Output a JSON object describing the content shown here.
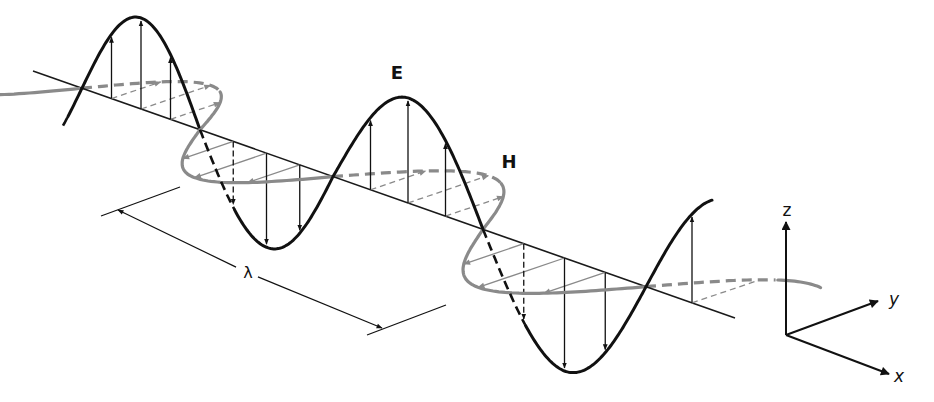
{
  "diagram": {
    "labels": {
      "electric_field": "E",
      "magnetic_field": "H",
      "wavelength": "λ",
      "axis_z": "z",
      "axis_y": "y",
      "axis_x": "x"
    },
    "colors": {
      "electric_field": "#111111",
      "magnetic_field": "#8a8a8a",
      "axis": "#1a1a1a",
      "background": "#ffffff"
    },
    "propagation_axis": {
      "start": [
        33,
        71
      ],
      "end": [
        735,
        318
      ]
    },
    "node_x_positions": [
      82,
      200,
      333,
      483,
      646
    ],
    "e_amplitudes": [
      91,
      94,
      105,
      113,
      115
    ],
    "h_direction": [
      1,
      -0.34
    ],
    "h_amplitude_scale": 0.95,
    "wavelength_marker": {
      "start": [
        118,
        210
      ],
      "end": [
        382,
        328
      ],
      "label_position": [
        247,
        272
      ]
    },
    "coordinate_axes": {
      "origin": [
        786,
        335
      ],
      "z_tip": [
        786,
        222
      ],
      "y_tip": [
        878,
        302
      ],
      "x_tip": [
        889,
        374
      ]
    }
  }
}
